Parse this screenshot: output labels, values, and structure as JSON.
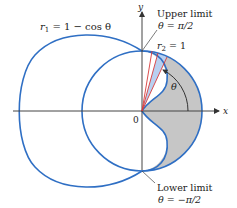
{
  "figure": {
    "curve1_label": "r₁ = 1 − cos θ",
    "curve1_r": "r",
    "curve1_sub": "1",
    "curve1_rest": " = 1 − cos θ",
    "curve2_r": "r",
    "curve2_sub": "2",
    "curve2_rest": " = 1",
    "upper_limit_title": "Upper limit",
    "upper_limit_value": "θ = π/2",
    "lower_limit_title": "Lower limit",
    "lower_limit_value": "θ = −π/2",
    "angle_label": "θ",
    "origin_label": "0",
    "x_axis_label": "x",
    "y_axis_label": "y"
  },
  "colors": {
    "curve": "#2f6fc4",
    "shaded_region": "#c4c4c4",
    "highlight_sector": "#b9d2f2",
    "ray": "#d83a3a",
    "axis": "#444444"
  }
}
